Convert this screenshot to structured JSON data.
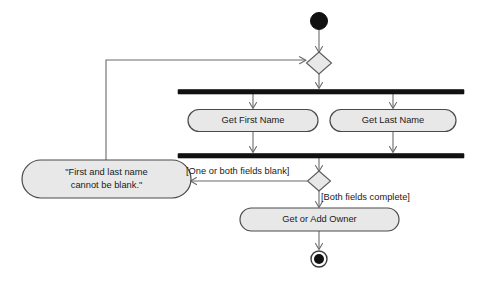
{
  "diagram": {
    "type": "uml-activity-diagram",
    "background_color": "#ffffff",
    "node_fill_color": "#e8e8e8",
    "node_stroke_color": "#4a4a4a",
    "edge_color": "#6b6b6b",
    "bar_color": "#111111"
  },
  "nodes": {
    "initial": {
      "name": "initial-node",
      "label": ""
    },
    "decision_1": {
      "name": "decision-node-entry",
      "label": ""
    },
    "fork": {
      "name": "fork-bar",
      "label": ""
    },
    "activity_first_name": {
      "label": "Get First Name"
    },
    "activity_last_name": {
      "label": "Get Last Name"
    },
    "join": {
      "name": "join-bar",
      "label": ""
    },
    "decision_2": {
      "name": "decision-node-validate",
      "label": ""
    },
    "activity_error": {
      "line1": "\"First and last name",
      "line2": "cannot be blank.\""
    },
    "activity_get_or_add_owner": {
      "label": "Get or Add Owner"
    },
    "final": {
      "name": "final-node",
      "label": ""
    }
  },
  "edges": {
    "guard_blank": "[One or both fields blank]",
    "guard_complete": "[Both fields complete]"
  }
}
